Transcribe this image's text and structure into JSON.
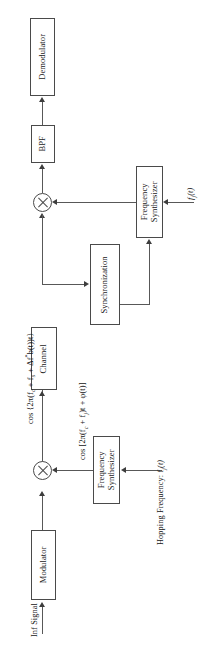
{
  "diagram": {
    "orientation": "rotated-90-ccw",
    "blocks": {
      "demodulator": "Demodulator",
      "bpf": "BPF",
      "frequency_synthesizer_rx_line1": "Frequency",
      "frequency_synthesizer_rx_line2": "Synthesizer",
      "synchronization": "Synchronization",
      "channel": "Channel",
      "frequency_synthesizer_tx_line1": "Frequency",
      "frequency_synthesizer_tx_line2": "Synthesizer",
      "modulator": "Modulator"
    },
    "labels": {
      "inf_signal": "Inf Signal",
      "hopping_frequency": "Hopping Frequency: f",
      "hopping_frequency_sub": "j",
      "hopping_frequency_tail": "(t)",
      "fj_input": "f",
      "fj_input_sub": "j",
      "fj_input_tail": "(t)",
      "channel_expr_prefix": "cos {2π(f",
      "channel_expr_sub1": "c",
      "channel_expr_mid1": " + f",
      "channel_expr_sub2": "s",
      "channel_expr_mid2": " + Δf",
      "channel_expr_sup": "*",
      "channel_expr_mid3": "b(t))t}",
      "mixer_expr_prefix": "cos [2π(f",
      "mixer_expr_sub1": "c",
      "mixer_expr_mid1": " + f",
      "mixer_expr_sub2": "j",
      "mixer_expr_mid2": ")t + φ(t)]"
    },
    "colors": {
      "stroke": "#4a4a4a",
      "line": "#585858",
      "text": "#141414",
      "background": "#ffffff"
    }
  }
}
